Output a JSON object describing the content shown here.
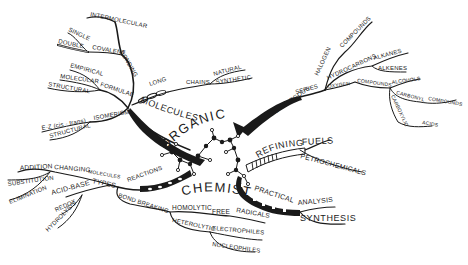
{
  "center": {
    "word1": "ORGANIC",
    "word2": "CHEMISTRY",
    "icon": "molecule-model"
  },
  "branches": {
    "molecules": {
      "label": "MOLECULES",
      "bonding": {
        "label": "BONDING",
        "intermolecular": "INTERMOLECULAR",
        "covalent": "COVALENT",
        "single": "SINGLE",
        "double": "DOUBLE"
      },
      "formulae": {
        "label": "FORMULAE",
        "empirical": "EMPIRICAL",
        "molecular": "MOLECULAR",
        "structural": "STRUCTURAL"
      },
      "isomerism": {
        "label": "ISOMERISM",
        "ez": "E-Z (cis - trans)",
        "structural": "STRUCTURAL"
      },
      "long_chains": {
        "long": "LONG",
        "chains": "CHAINS",
        "natural": "NATURAL",
        "synthetic": "SYNTHETIC"
      }
    },
    "homologous": {
      "label": "HOMOLOGOUS",
      "series": "SERIES",
      "halogen": "HALOGEN",
      "halogen_compounds": "COMPOUNDS",
      "hydrocarbons": "HYDROCARBONS",
      "alkanes": "ALKANES",
      "alkenes": "ALKENES",
      "oxygen": "OXYGEN",
      "oxygen_compounds": "COMPOUNDS",
      "alcohols": "ALCOHOLS",
      "carbonyl": "CARBONYL",
      "carbonyl_compounds": "COMPOUNDS",
      "carboxylic": "CARBOXYLIC",
      "acids": "ACIDS"
    },
    "refining": {
      "label": "REFINING",
      "fuels": "FUELS",
      "petrochemicals": "PETROCHEMICALS"
    },
    "practical": {
      "label": "PRACTICAL",
      "analysis": "ANALYSIS",
      "synthesis": "SYNTHESIS"
    },
    "reactions": {
      "label": "REACTIONS",
      "types": "TYPES",
      "acid_base": "ACID-BASE",
      "redox": "REDOX",
      "hydrolysis": "HYDROLYSIS",
      "changing": "CHANGING",
      "molecules": "MOLECULES",
      "addition": "ADDITION",
      "substitution": "SUBSTITUTION",
      "elimination": "ELIMINATION",
      "bond_breaking": "BOND BREAKING",
      "homolytic": "HOMOLYTIC",
      "free": "FREE",
      "radicals": "RADICALS",
      "heterolytic": "HETEROLYTIC",
      "electrophiles": "ELECTROPHILES",
      "nucleophiles": "NUCLEOPHILES"
    }
  }
}
